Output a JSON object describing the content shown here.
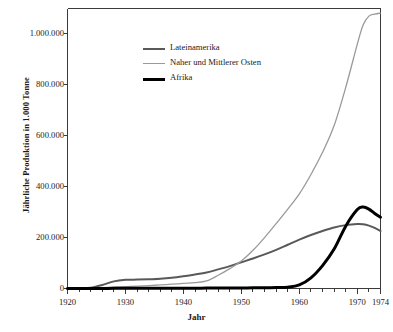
{
  "chart_data": {
    "type": "line",
    "title": "",
    "xlabel": "Jahr",
    "ylabel": "Jährliche Produktion in 1.000 Tonne",
    "xlim": [
      1920,
      1974
    ],
    "ylim": [
      0,
      1100000
    ],
    "grid": false,
    "legend_position": "upper-left-inside",
    "xticks": [
      "1920",
      "1930",
      "1940",
      "1950",
      "1960",
      "1970",
      "1974"
    ],
    "xtick_values": [
      1920,
      1930,
      1940,
      1950,
      1960,
      1970,
      1974
    ],
    "yticks": [
      "0",
      "200.000",
      "400.000",
      "600.000",
      "800.000",
      "1.000.000"
    ],
    "ytick_values": [
      0,
      200000,
      400000,
      600000,
      800000,
      1000000
    ],
    "x": [
      1920,
      1922,
      1924,
      1926,
      1928,
      1930,
      1932,
      1934,
      1936,
      1938,
      1940,
      1942,
      1944,
      1946,
      1948,
      1950,
      1952,
      1954,
      1956,
      1958,
      1960,
      1962,
      1964,
      1966,
      1968,
      1970,
      1971,
      1972,
      1973,
      1974
    ],
    "series": [
      {
        "name": "Lateinamerika",
        "color": "#595959",
        "width": 2.0,
        "values": [
          1000,
          1500,
          3000,
          14000,
          28000,
          34000,
          35000,
          36000,
          38000,
          42000,
          48000,
          55000,
          63000,
          75000,
          88000,
          103000,
          118000,
          134000,
          152000,
          172000,
          192000,
          210000,
          226000,
          240000,
          249000,
          253000,
          252000,
          247000,
          238000,
          226000
        ]
      },
      {
        "name": "Naher und Mittlerer Osten",
        "color": "#9a9a9a",
        "width": 1.3,
        "values": [
          500,
          900,
          1800,
          3200,
          5200,
          7500,
          9500,
          11500,
          14000,
          17000,
          20000,
          23000,
          30000,
          52000,
          78000,
          108000,
          150000,
          200000,
          255000,
          312000,
          372000,
          448000,
          535000,
          640000,
          790000,
          960000,
          1035000,
          1070000,
          1078000,
          1082000
        ]
      },
      {
        "name": "Afrika",
        "color": "#000000",
        "width": 3.0,
        "values": [
          300,
          350,
          400,
          450,
          500,
          600,
          700,
          800,
          900,
          1000,
          1100,
          1300,
          1500,
          1800,
          2000,
          2300,
          2600,
          3000,
          3500,
          5000,
          14000,
          42000,
          90000,
          155000,
          245000,
          310000,
          320000,
          312000,
          295000,
          280000
        ]
      }
    ]
  },
  "axes": {
    "y_title": "Jährliche Produktion in 1.000 Tonne",
    "x_title": "Jahr"
  },
  "legend": {
    "items": [
      {
        "label": "Lateinamerika"
      },
      {
        "label": "Naher und Mittlerer Osten"
      },
      {
        "label": "Afrika"
      }
    ]
  },
  "colors": {
    "lateinamerika": "#595959",
    "naher_und_mittlerer_osten": "#9a9a9a",
    "afrika": "#000000",
    "axis": "#3a3a3a",
    "background": "#ffffff"
  }
}
